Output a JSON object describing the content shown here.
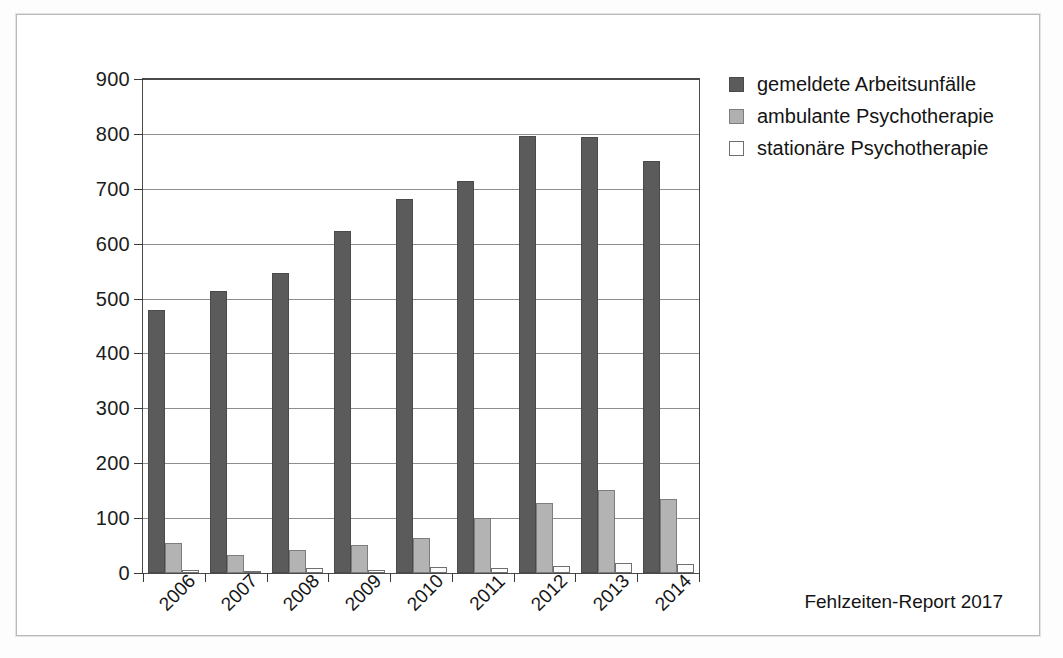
{
  "chart_data": {
    "type": "bar",
    "title": "",
    "xlabel": "",
    "ylabel": "",
    "ylim": [
      0,
      900
    ],
    "yticks": [
      0,
      100,
      200,
      300,
      400,
      500,
      600,
      700,
      800,
      900
    ],
    "grid": true,
    "legend_position": "right-top",
    "categories": [
      "2006",
      "2007",
      "2008",
      "2009",
      "2010",
      "2011",
      "2012",
      "2013",
      "2014"
    ],
    "series": [
      {
        "name": "gemeldete Arbeitsunfälle",
        "color": "#5b5b5b",
        "values": [
          480,
          513,
          546,
          624,
          681,
          715,
          796,
          794,
          751
        ]
      },
      {
        "name": "ambulante Psychotherapie",
        "color": "#b0b0b0",
        "values": [
          54,
          32,
          42,
          51,
          63,
          100,
          127,
          151,
          135
        ]
      },
      {
        "name": "stationäre Psychotherapie",
        "color": "#ffffff",
        "values": [
          5,
          3,
          9,
          6,
          11,
          10,
          13,
          19,
          17
        ]
      }
    ]
  },
  "legend": {
    "items": [
      {
        "label": "gemeldete Arbeitsunfälle",
        "swatch": "dark-gray-square-icon"
      },
      {
        "label": "ambulante Psychotherapie",
        "swatch": "mid-gray-square-icon"
      },
      {
        "label": "stationäre Psychotherapie",
        "swatch": "white-square-icon"
      }
    ]
  },
  "footer": {
    "source": "Fehlzeiten-Report 2017"
  }
}
